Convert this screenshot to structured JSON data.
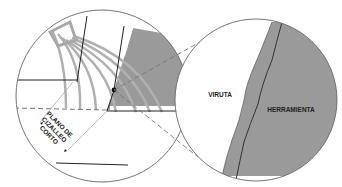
{
  "diagram": {
    "type": "technical-illustration",
    "labels": {
      "shear_plane_line1": "PLANO DE",
      "shear_plane_line2": "CIZALLEO",
      "shear_plane_line3": "CORTO",
      "chip": "VIRUTA",
      "tool": "HERRAMIENTA"
    },
    "colors": {
      "tool_fill": "#9a9a9a",
      "chip_lines": "#b0b0b0",
      "outline": "#555555",
      "dark_line": "#222222",
      "dashed": "#777777",
      "background": "#ffffff"
    }
  }
}
